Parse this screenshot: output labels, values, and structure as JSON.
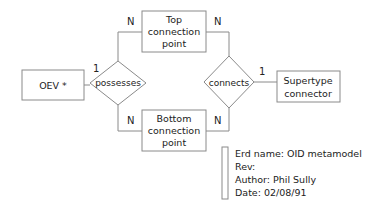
{
  "diagram": {
    "type": "entity-relationship",
    "entities": [
      {
        "id": "oev",
        "lines": [
          "OEV *"
        ]
      },
      {
        "id": "top",
        "lines": [
          "Top",
          "connection",
          "point"
        ]
      },
      {
        "id": "bottom",
        "lines": [
          "Bottom",
          "connection",
          "point"
        ]
      },
      {
        "id": "supertype",
        "lines": [
          "Supertype",
          "connector"
        ]
      }
    ],
    "relationships": [
      {
        "id": "possesses",
        "label": "possesses"
      },
      {
        "id": "connects",
        "label": "connects"
      }
    ],
    "cardinalities": {
      "possesses_oev": "1",
      "possesses_top": "N",
      "possesses_bottom": "N",
      "connects_top": "N",
      "connects_bottom": "N",
      "connects_supertype": "1"
    },
    "info": {
      "lines": [
        "Erd name: OID metamodel",
        "Rev:",
        "Author: Phil Sully",
        "Date: 02/08/91"
      ]
    },
    "colors": {
      "stroke": "#8a8a8a",
      "text": "#222222",
      "background": "#ffffff"
    }
  }
}
